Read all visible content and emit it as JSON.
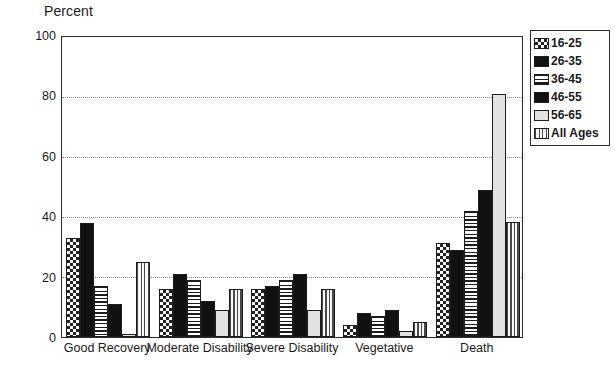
{
  "chart_data": {
    "type": "bar",
    "title": "",
    "xlabel": "",
    "ylabel": "Percent",
    "ylim": [
      0,
      100
    ],
    "yticks": [
      0,
      20,
      40,
      60,
      80,
      100
    ],
    "grid": true,
    "legend_position": "right",
    "categories": [
      "Good Recovery",
      "Moderate Disability",
      "Severe Disability",
      "Vegetative",
      "Death"
    ],
    "series": [
      {
        "name": "16-25",
        "pattern": "cross-hatch",
        "values": [
          33,
          16,
          16,
          4,
          31.5
        ]
      },
      {
        "name": "26-35",
        "pattern": "solid-black",
        "values": [
          38,
          21,
          17,
          8,
          29
        ]
      },
      {
        "name": "36-45",
        "pattern": "horizontal-lines",
        "values": [
          17,
          19,
          19,
          7,
          42
        ]
      },
      {
        "name": "46-55",
        "pattern": "solid-black",
        "values": [
          11,
          12,
          21,
          9,
          49
        ]
      },
      {
        "name": "56-65",
        "pattern": "light-solid",
        "values": [
          1,
          9,
          9,
          2,
          81
        ]
      },
      {
        "name": "All Ages",
        "pattern": "vertical-lines",
        "values": [
          25,
          16,
          16,
          5,
          38.5
        ]
      }
    ]
  },
  "legend": {
    "items": [
      {
        "label": "16-25"
      },
      {
        "label": "26-35"
      },
      {
        "label": "36-45"
      },
      {
        "label": "46-55"
      },
      {
        "label": "56-65"
      },
      {
        "label": "All Ages"
      }
    ]
  }
}
